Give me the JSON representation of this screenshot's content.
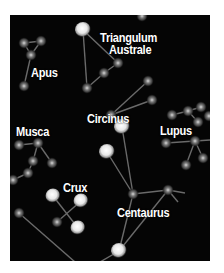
{
  "map": {
    "background": "#050505",
    "labels": {
      "triangulum_1": "Triangulum",
      "triangulum_2": "Australe",
      "apus": "Apus",
      "circinus": "Circinus",
      "musca": "Musca",
      "lupus": "Lupus",
      "crux": "Crux",
      "centaurus": "Centaurus"
    }
  }
}
